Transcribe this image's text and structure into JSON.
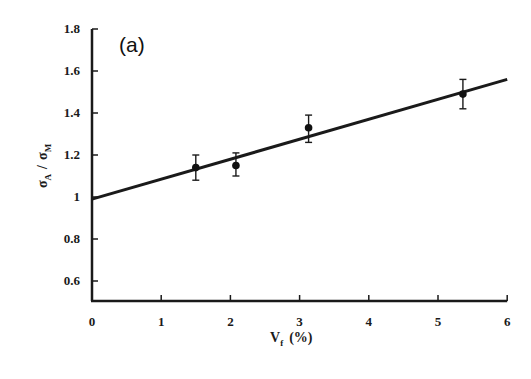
{
  "chart_data": {
    "type": "scatter",
    "panel_label": "(a)",
    "title": "",
    "xlabel": "V_f (%)",
    "ylabel": "σ_A / σ_M",
    "xlim": [
      0,
      6
    ],
    "ylim": [
      0.5,
      1.8
    ],
    "x_ticks": [
      0,
      1,
      2,
      3,
      4,
      5,
      6
    ],
    "y_ticks": [
      0.6,
      0.8,
      1,
      1.2,
      1.4,
      1.6,
      1.8
    ],
    "x_tick_labels": [
      "0",
      "1",
      "2",
      "3",
      "4",
      "5",
      "6"
    ],
    "y_tick_labels": [
      "0.6",
      "0.8",
      "1",
      "1.2",
      "1.4",
      "1.6",
      "1.8"
    ],
    "grid": false,
    "legend": null,
    "series": [
      {
        "name": "measured",
        "marker": "filled-circle",
        "x": [
          1.5,
          2.08,
          3.13,
          5.36
        ],
        "y": [
          1.14,
          1.15,
          1.33,
          1.49
        ],
        "y_err_low": [
          1.08,
          1.1,
          1.26,
          1.42
        ],
        "y_err_high": [
          1.2,
          1.21,
          1.39,
          1.56
        ]
      },
      {
        "name": "linear fit",
        "type": "line",
        "x": [
          0,
          6
        ],
        "y": [
          0.99,
          1.56
        ]
      }
    ]
  },
  "labels": {
    "panel": "(a)",
    "x_axis_main": "V",
    "x_axis_sub": "f",
    "x_axis_unit": "(%)",
    "y_axis_sigma1": "σ",
    "y_axis_sub1": "A",
    "y_axis_sep": "/",
    "y_axis_sigma2": "σ",
    "y_axis_sub2": "M"
  }
}
